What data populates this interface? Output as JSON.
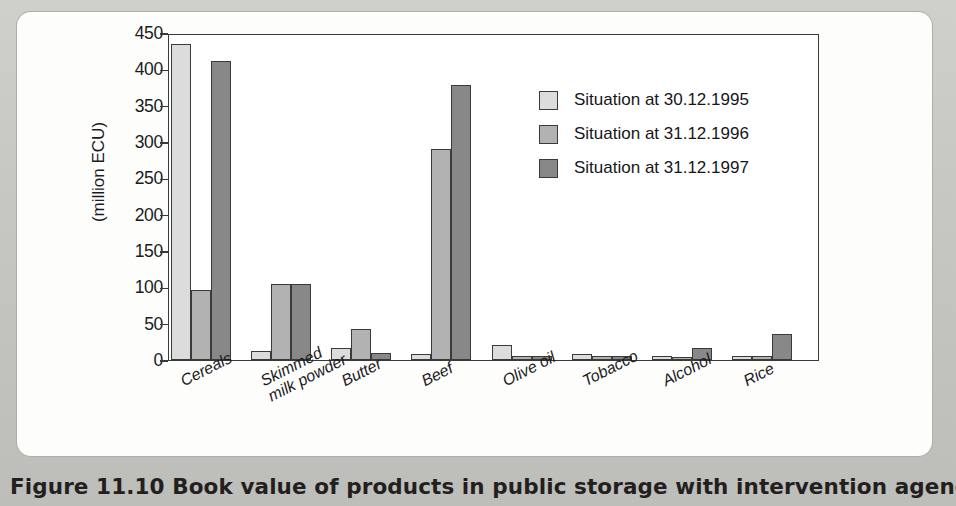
{
  "caption": "Figure 11.10  Book value of products in public storage with intervention agencies",
  "legend": {
    "position": "inside-top-right",
    "entries": [
      {
        "label": "Situation at 30.12.1995",
        "color": "#dcdcdc"
      },
      {
        "label": "Situation at 31.12.1996",
        "color": "#b2b2b2"
      },
      {
        "label": "Situation at 31.12.1997",
        "color": "#888889"
      }
    ]
  },
  "chart_data": {
    "type": "bar",
    "title": "Book value of products in public storage with intervention agencies",
    "xlabel": "",
    "ylabel": "(million ECU)",
    "ylim": [
      0,
      450
    ],
    "yticks": [
      0,
      50,
      100,
      150,
      200,
      250,
      300,
      350,
      400,
      450
    ],
    "ytick_labels": [
      "0",
      "50",
      "100",
      "150",
      "200",
      "250",
      "300",
      "350",
      "400",
      "450"
    ],
    "grid": false,
    "categories": [
      "Cereals",
      "Skimmed\nmilk powder",
      "Butter",
      "Beef",
      "Olive oil",
      "Tobacco",
      "Alcohol",
      "Rice"
    ],
    "category_lines": [
      [
        "Cereals"
      ],
      [
        "Skimmed",
        "milk powder"
      ],
      [
        "Butter"
      ],
      [
        "Beef"
      ],
      [
        "Olive oil"
      ],
      [
        "Tobacco"
      ],
      [
        "Alcohol"
      ],
      [
        "Rice"
      ]
    ],
    "series": [
      {
        "name": "Situation at 30.12.1995",
        "color": "#dcdcdc",
        "values": [
          435,
          13,
          17,
          8,
          20,
          8,
          6,
          5
        ]
      },
      {
        "name": "Situation at 31.12.1996",
        "color": "#b2b2b2",
        "values": [
          96,
          105,
          43,
          291,
          6,
          6,
          4,
          5
        ]
      },
      {
        "name": "Situation at 31.12.1997",
        "color": "#888889",
        "values": [
          412,
          105,
          9,
          378,
          6,
          6,
          16,
          36
        ]
      }
    ]
  }
}
